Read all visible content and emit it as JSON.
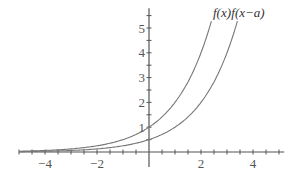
{
  "chart_data": {
    "type": "line",
    "title": "",
    "xlabel": "",
    "ylabel": "",
    "xlim": [
      -5,
      5.2
    ],
    "ylim": [
      -0.6,
      5.8
    ],
    "grid": false,
    "x_tick_labels": [
      "-4",
      "-2",
      "2",
      "4"
    ],
    "x_ticks": [
      -4,
      -2,
      2,
      4
    ],
    "y_tick_labels": [
      "1",
      "2",
      "3",
      "4",
      "5"
    ],
    "y_ticks": [
      1,
      2,
      3,
      4,
      5
    ],
    "minor_tick_step": 0.5,
    "series": [
      {
        "name": "f(x)",
        "formula": "2^x",
        "x": [
          -5,
          -4,
          -3,
          -2,
          -1,
          0,
          1,
          2,
          2.4
        ],
        "values": [
          0.03,
          0.06,
          0.13,
          0.25,
          0.5,
          1,
          2,
          4,
          5.28
        ]
      },
      {
        "name": "f(x−a)",
        "formula": "2^(x-1)",
        "x": [
          -5,
          -4,
          -3,
          -2,
          -1,
          0,
          1,
          2,
          3,
          3.4
        ],
        "values": [
          0.02,
          0.03,
          0.06,
          0.13,
          0.25,
          0.5,
          1,
          2,
          4,
          5.28
        ]
      }
    ],
    "annotations": [
      "f(x)",
      "f(x−a)"
    ],
    "colors": {
      "axis": "#555555",
      "curve": "#777777",
      "text": "#333333"
    }
  }
}
